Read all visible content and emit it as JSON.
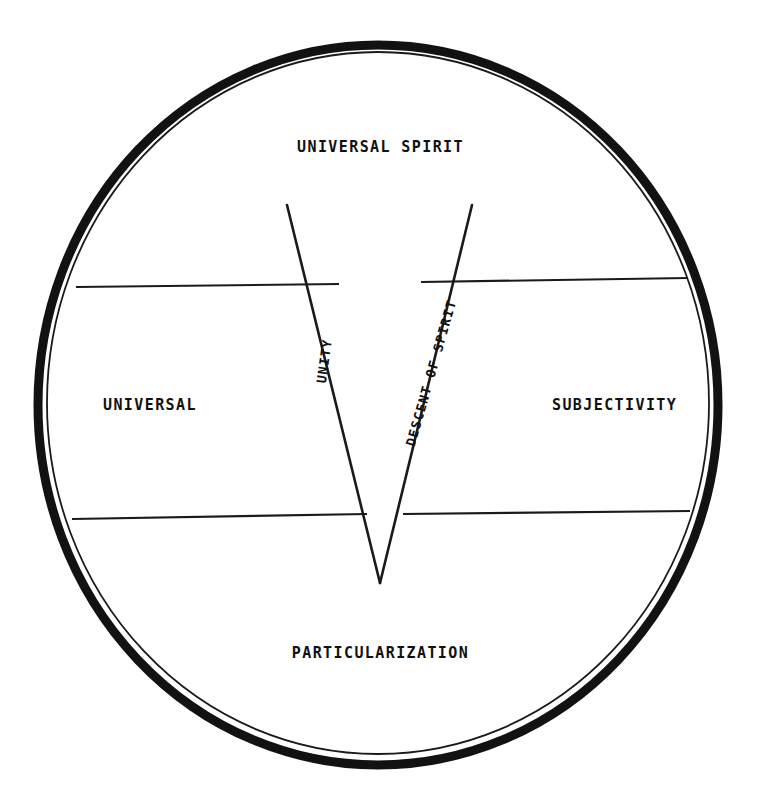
{
  "diagram": {
    "background_color": "#ffffff",
    "ink_color": "#111111",
    "labels": {
      "top": "UNIVERSAL SPIRIT",
      "bottom": "PARTICULARIZATION",
      "left": "UNIVERSAL",
      "right": "SUBJECTIVITY",
      "wedge_left": "UNITY",
      "wedge_right": "DESCENT OF SPIRIT"
    },
    "shapes": {
      "outer_ring": {
        "name": "outer-circle-thick",
        "cx": 378,
        "cy": 405,
        "rx": 340,
        "ry": 360,
        "stroke_width": 9
      },
      "inner_ring": {
        "name": "inner-circle-thin",
        "cx": 378,
        "cy": 403,
        "rx": 331,
        "ry": 351,
        "stroke_width": 2
      },
      "wedge": {
        "name": "central-v-wedge",
        "apex_x": 380,
        "apex_y": 583,
        "left_top_x": 287,
        "left_top_y": 205,
        "right_top_x": 472,
        "right_top_y": 205,
        "gap_left_x": 364,
        "gap_right_x": 398
      },
      "divider_upper_left": {
        "x1": 76,
        "y1": 287,
        "x2": 339,
        "y2": 284
      },
      "divider_upper_right": {
        "x1": 421,
        "y1": 282,
        "x2": 688,
        "y2": 278
      },
      "divider_lower_left": {
        "x1": 72,
        "y1": 519,
        "x2": 367,
        "y2": 514
      },
      "divider_lower_right": {
        "x1": 403,
        "y1": 514,
        "x2": 690,
        "y2": 511
      }
    }
  }
}
